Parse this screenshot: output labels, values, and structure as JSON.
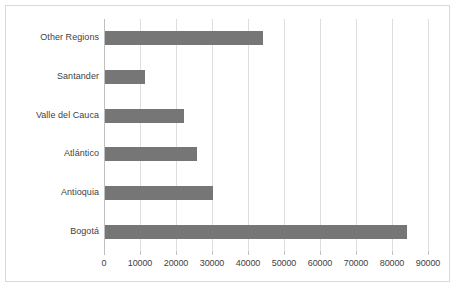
{
  "chart_data": {
    "type": "bar",
    "orientation": "horizontal",
    "title": "",
    "subtitle": "",
    "xlabel": "",
    "ylabel": "",
    "categories": [
      "Bogotá",
      "Antioquia",
      "Atlántico",
      "Valle del Cauca",
      "Santander",
      "Other Regions"
    ],
    "values": [
      84000,
      30000,
      25500,
      22000,
      11000,
      44000
    ],
    "series": [
      {
        "name": "",
        "values": [
          84000,
          30000,
          25500,
          22000,
          11000,
          44000
        ]
      }
    ],
    "xlim": [
      0,
      90000
    ],
    "xticks": [
      0,
      10000,
      20000,
      30000,
      40000,
      50000,
      60000,
      70000,
      80000,
      90000
    ],
    "xtick_labels": [
      "0",
      "10000",
      "20000",
      "30000",
      "40000",
      "50000",
      "60000",
      "70000",
      "80000",
      "90000"
    ],
    "grid": "vertical",
    "legend": "none",
    "bar_color": "#767676",
    "grid_color": "#dedede",
    "axis_color": "#bfbfbf",
    "border_color": "#d9d9d9",
    "text_color": "#3f3f3f",
    "plot_background": "#ffffff"
  }
}
